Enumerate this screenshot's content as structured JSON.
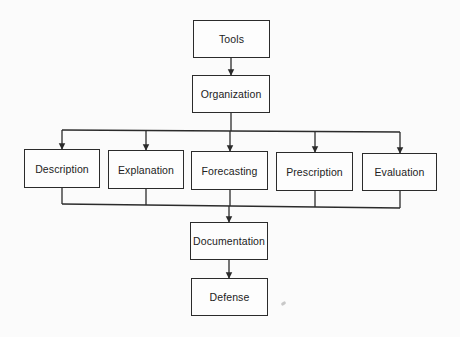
{
  "diagram": {
    "type": "flowchart",
    "nodes": [
      {
        "id": "tools",
        "label": "Tools",
        "x": 193,
        "y": 20,
        "w": 77,
        "h": 38
      },
      {
        "id": "organization",
        "label": "Organization",
        "x": 192,
        "y": 75,
        "w": 78,
        "h": 38
      },
      {
        "id": "description",
        "label": "Description",
        "x": 24,
        "y": 149,
        "w": 76,
        "h": 39
      },
      {
        "id": "explanation",
        "label": "Explanation",
        "x": 108,
        "y": 150,
        "w": 76,
        "h": 39
      },
      {
        "id": "forecasting",
        "label": "Forecasting",
        "x": 191,
        "y": 151,
        "w": 77,
        "h": 39
      },
      {
        "id": "prescription",
        "label": "Prescription",
        "x": 276,
        "y": 152,
        "w": 77,
        "h": 39
      },
      {
        "id": "evaluation",
        "label": "Evaluation",
        "x": 362,
        "y": 153,
        "w": 75,
        "h": 38
      },
      {
        "id": "documentation",
        "label": "Documentation",
        "x": 190,
        "y": 222,
        "w": 78,
        "h": 38
      },
      {
        "id": "defense",
        "label": "Defense",
        "x": 191,
        "y": 278,
        "w": 77,
        "h": 38
      }
    ],
    "edges": [
      {
        "from": "tools",
        "to": "organization"
      },
      {
        "from": "organization",
        "to": "description"
      },
      {
        "from": "organization",
        "to": "explanation"
      },
      {
        "from": "organization",
        "to": "forecasting"
      },
      {
        "from": "organization",
        "to": "prescription"
      },
      {
        "from": "organization",
        "to": "evaluation"
      },
      {
        "from": "description",
        "to": "documentation"
      },
      {
        "from": "explanation",
        "to": "documentation"
      },
      {
        "from": "forecasting",
        "to": "documentation"
      },
      {
        "from": "prescription",
        "to": "documentation"
      },
      {
        "from": "evaluation",
        "to": "documentation"
      },
      {
        "from": "documentation",
        "to": "defense"
      }
    ]
  },
  "colors": {
    "line": "#2b2b2b",
    "background": "#fbfbfb",
    "text": "#222222"
  }
}
